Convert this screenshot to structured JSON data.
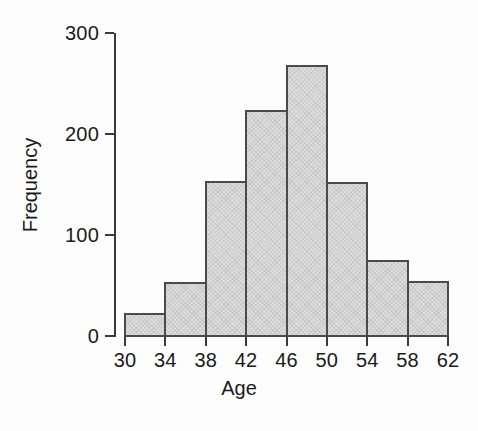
{
  "figure": {
    "background_color": "#fdfdfd",
    "ink_color": "#1a1a1a",
    "bar_fill_color": "#dcdcdc",
    "bar_edge_color": "#4a4a4a"
  },
  "chart_data": {
    "type": "bar",
    "title": "",
    "subtitle": "",
    "xlabel": "Age",
    "ylabel": "Frequency",
    "xlim": [
      30,
      62
    ],
    "ylim": [
      0,
      300
    ],
    "grid": false,
    "legend": null,
    "bin_width": 4,
    "bin_edges": [
      30,
      34,
      38,
      42,
      46,
      50,
      54,
      58,
      62
    ],
    "categories": [
      "30-34",
      "34-38",
      "38-42",
      "42-46",
      "46-50",
      "50-54",
      "54-58",
      "58-62"
    ],
    "values": [
      23,
      53,
      153,
      224,
      268,
      152,
      75,
      54
    ],
    "xticks": [
      30,
      34,
      38,
      42,
      46,
      50,
      54,
      58,
      62
    ],
    "xtick_labels": [
      "30",
      "34",
      "38",
      "42",
      "46",
      "50",
      "54",
      "58",
      "62"
    ],
    "yticks": [
      0,
      100,
      200,
      300
    ],
    "ytick_labels": [
      "0",
      "100",
      "200",
      "300"
    ],
    "bars": [
      {
        "label": "30-34",
        "x0": 30,
        "x1": 34,
        "value": 23
      },
      {
        "label": "34-38",
        "x0": 34,
        "x1": 38,
        "value": 53
      },
      {
        "label": "38-42",
        "x0": 38,
        "x1": 42,
        "value": 153
      },
      {
        "label": "42-46",
        "x0": 42,
        "x1": 46,
        "value": 224
      },
      {
        "label": "46-50",
        "x0": 46,
        "x1": 50,
        "value": 268
      },
      {
        "label": "50-54",
        "x0": 50,
        "x1": 54,
        "value": 152
      },
      {
        "label": "54-58",
        "x0": 54,
        "x1": 58,
        "value": 75
      },
      {
        "label": "58-62",
        "x0": 58,
        "x1": 62,
        "value": 54
      }
    ]
  }
}
